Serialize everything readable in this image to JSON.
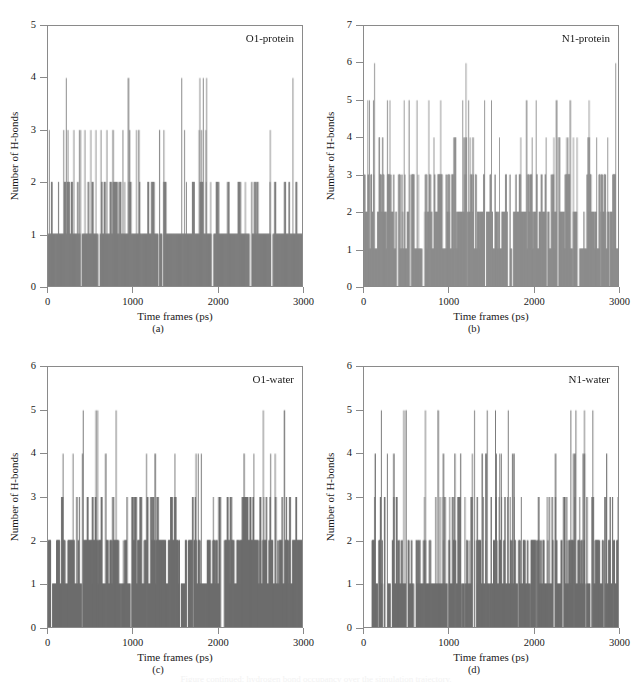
{
  "figure": {
    "panels": [
      {
        "id": "a",
        "caption": "(a)",
        "series_label": "O1-protein",
        "xlabel": "Time frames (ps)",
        "ylabel": "Number of H-bonds",
        "yticks": [
          0,
          1,
          2,
          3,
          4,
          5
        ],
        "xticks": [
          0,
          1000,
          2000,
          3000
        ],
        "ylim": [
          0,
          5
        ],
        "xlim": [
          0,
          3000
        ],
        "bar_color": "#7f7f7f"
      },
      {
        "id": "b",
        "caption": "(b)",
        "series_label": "N1-protein",
        "xlabel": "Time frames (ps)",
        "ylabel": "Number of H-bonds",
        "yticks": [
          0,
          1,
          2,
          3,
          4,
          5,
          6,
          7
        ],
        "xticks": [
          0,
          1000,
          2000,
          3000
        ],
        "ylim": [
          0,
          7
        ],
        "xlim": [
          0,
          3000
        ],
        "bar_color": "#8d8d8d"
      },
      {
        "id": "c",
        "caption": "(c)",
        "series_label": "O1-water",
        "xlabel": "Time frames (ps)",
        "ylabel": "Number of H-bonds",
        "yticks": [
          0,
          1,
          2,
          3,
          4,
          5,
          6
        ],
        "xticks": [
          0,
          1000,
          2000,
          3000
        ],
        "ylim": [
          0,
          6
        ],
        "xlim": [
          0,
          3000
        ],
        "bar_color": "#6e6e6e"
      },
      {
        "id": "d",
        "caption": "(d)",
        "series_label": "N1-water",
        "xlabel": "Time frames (ps)",
        "ylabel": "Number of H-bonds",
        "yticks": [
          0,
          1,
          2,
          3,
          4,
          5,
          6
        ],
        "xticks": [
          0,
          1000,
          2000,
          3000
        ],
        "ylim": [
          0,
          6
        ],
        "xlim": [
          0,
          3000
        ],
        "bar_color": "#6e6e6e"
      }
    ],
    "bottom_clipped_caption": "Figure continued: hydrogen bond occupancy over the simulation trajectory."
  },
  "chart_data": [
    {
      "id": "a",
      "type": "bar",
      "title": "O1-protein",
      "xlabel": "Time frames (ps)",
      "ylabel": "Number of H-bonds",
      "xlim": [
        0,
        3000
      ],
      "ylim": [
        0,
        5
      ],
      "xticks": [
        0,
        1000,
        2000,
        3000
      ],
      "yticks": [
        0,
        1,
        2,
        3,
        4,
        5
      ],
      "grid": false,
      "legend": "none",
      "series_name": "O1-protein H-bonds",
      "description": "Per-frame hydrogen-bond count between ligand O1 atom and protein; baseline mostly 1, frequent excursions to 2, occasional 3, rare 4.",
      "baseline_level": 1,
      "level_fractions": {
        "0": 0.06,
        "1": 0.55,
        "2": 0.33,
        "3": 0.05,
        "4": 0.01
      },
      "spike_levels_4": [
        210,
        1790,
        1830,
        1870,
        2890
      ],
      "spike_levels_3_region": [
        10,
        180,
        230,
        300,
        380,
        430,
        500,
        560,
        620,
        690,
        760,
        880,
        960,
        1040,
        1070,
        1780,
        1810,
        1860
      ],
      "seed": 11
    },
    {
      "id": "b",
      "type": "bar",
      "title": "N1-protein",
      "xlabel": "Time frames (ps)",
      "ylabel": "Number of H-bonds",
      "xlim": [
        0,
        3000
      ],
      "ylim": [
        0,
        7
      ],
      "xticks": [
        0,
        1000,
        2000,
        3000
      ],
      "yticks": [
        0,
        1,
        2,
        3,
        4,
        5,
        6,
        7
      ],
      "grid": false,
      "legend": "none",
      "series_name": "N1-protein H-bonds",
      "description": "Per-frame hydrogen-bond count between ligand N1 atom and protein; dense band between 1 and 3, common 4s, periodic 5s, two spikes reaching 6.",
      "baseline_level": 2,
      "level_fractions": {
        "0": 0.08,
        "1": 0.18,
        "2": 0.32,
        "3": 0.27,
        "4": 0.12,
        "5": 0.025,
        "6": 0.005
      },
      "spike_levels_6": [
        120,
        1200
      ],
      "spike_levels_5": [
        40,
        60,
        270,
        300,
        620,
        760,
        900,
        1160,
        1230,
        1420,
        1500,
        2030
      ],
      "seed": 23
    },
    {
      "id": "c",
      "type": "bar",
      "title": "O1-water",
      "xlabel": "Time frames (ps)",
      "ylabel": "Number of H-bonds",
      "xlim": [
        0,
        3000
      ],
      "ylim": [
        0,
        6
      ],
      "xticks": [
        0,
        1000,
        2000,
        3000
      ],
      "yticks": [
        0,
        1,
        2,
        3,
        4,
        5,
        6
      ],
      "grid": false,
      "legend": "none",
      "series_name": "O1-water H-bonds",
      "description": "Per-frame hydrogen-bond count between ligand O1 atom and water; solid band up to 2, very frequent 3s, regular 4s, four isolated 5s.",
      "baseline_level": 2,
      "level_fractions": {
        "0": 0.05,
        "1": 0.25,
        "2": 0.42,
        "3": 0.22,
        "4": 0.055,
        "5": 0.005
      },
      "spike_levels_5": [
        410,
        560,
        580,
        800,
        2540
      ],
      "seed": 37
    },
    {
      "id": "d",
      "type": "bar",
      "title": "N1-water",
      "xlabel": "Time frames (ps)",
      "ylabel": "Number of H-bonds",
      "xlim": [
        0,
        3000
      ],
      "ylim": [
        0,
        6
      ],
      "xticks": [
        0,
        1000,
        2000,
        3000
      ],
      "yticks": [
        0,
        1,
        2,
        3,
        4,
        5,
        6
      ],
      "grid": false,
      "legend": "none",
      "series_name": "N1-water H-bonds",
      "description": "Per-frame hydrogen-bond count between ligand N1 atom and water; dense 1-2 band, broad 3 plateau especially 1000-1900, many 4s, several 5s.",
      "baseline_level": 1,
      "level_fractions": {
        "0": 0.12,
        "1": 0.28,
        "2": 0.33,
        "3": 0.2,
        "4": 0.065,
        "5": 0.005
      },
      "spike_levels_5": [
        200,
        720,
        1300,
        1450,
        1550,
        1700,
        2440,
        2500,
        2600,
        2700
      ],
      "seed": 53
    }
  ]
}
